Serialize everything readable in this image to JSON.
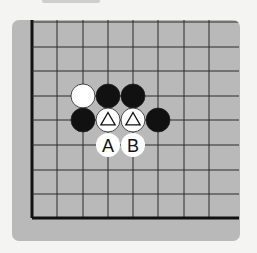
{
  "diagram": {
    "type": "go-board-corner",
    "colors": {
      "page_bg": "#f4f4f2",
      "board_bg": "#b9b9b9",
      "grid_line": "#2a2a2a",
      "edge_line": "#111111",
      "black_stone": "#111111",
      "white_stone": "#ffffff"
    },
    "grid": {
      "columns_x": [
        32,
        57,
        83,
        108,
        133,
        158,
        184,
        209
      ],
      "rows_y": [
        22,
        47,
        71,
        96,
        120,
        145,
        170,
        194,
        218
      ],
      "right_extent": 239,
      "thick_edges": [
        "left",
        "bottom"
      ]
    },
    "stones": [
      {
        "color": "white",
        "col": 2,
        "row": 3,
        "mark": ""
      },
      {
        "color": "black",
        "col": 3,
        "row": 3,
        "mark": ""
      },
      {
        "color": "black",
        "col": 4,
        "row": 3,
        "mark": ""
      },
      {
        "color": "black",
        "col": 2,
        "row": 4,
        "mark": ""
      },
      {
        "color": "white",
        "col": 3,
        "row": 4,
        "mark": "triangle"
      },
      {
        "color": "white",
        "col": 4,
        "row": 4,
        "mark": "triangle"
      },
      {
        "color": "black",
        "col": 5,
        "row": 4,
        "mark": ""
      }
    ],
    "labels": [
      {
        "text": "A",
        "col": 3,
        "row": 5
      },
      {
        "text": "B",
        "col": 4,
        "row": 5
      }
    ]
  }
}
